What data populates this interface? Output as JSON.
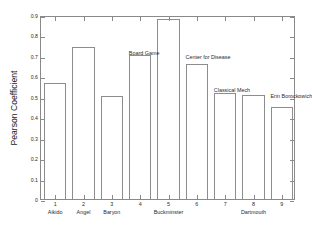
{
  "chart_data": {
    "type": "bar",
    "title": "",
    "xlabel": "",
    "ylabel": "Pearson Coefficient",
    "categories": [
      "1",
      "2",
      "3",
      "4",
      "5",
      "6",
      "7",
      "8",
      "9"
    ],
    "values": [
      0.567,
      0.743,
      0.505,
      0.705,
      0.88,
      0.66,
      0.518,
      0.508,
      0.448
    ],
    "ylim": [
      0,
      0.9
    ],
    "xlim": [
      0.5,
      9.5
    ],
    "ytick_labels": [
      "0",
      "0.1",
      "0.2",
      "0.3",
      "0.4",
      "0.5",
      "0.6",
      "0.7",
      "0.8",
      "0.9"
    ],
    "ytick_values": [
      0,
      0.1,
      0.2,
      0.3,
      0.4,
      0.5,
      0.6,
      0.7,
      0.8,
      0.9
    ],
    "xtick_labels": [
      "1",
      "2",
      "3",
      "4",
      "5",
      "6",
      "7",
      "8",
      "9"
    ],
    "grid": false,
    "legend": "none",
    "bar_fill": "#ffffff",
    "bar_edge": "#8d8d8d",
    "axis_color": "#8a8a8a",
    "category_labels": [
      {
        "text": "Aikido",
        "x": 1
      },
      {
        "text": "Angel",
        "x": 2
      },
      {
        "text": "Baryon",
        "x": 3
      },
      {
        "text": "Buckminster",
        "x": 5
      },
      {
        "text": "Dartmouth",
        "x": 8
      }
    ],
    "annotations": [
      {
        "text": "Board Game",
        "x": 4,
        "y": 0.735
      },
      {
        "text": "Center for Disease",
        "x": 6,
        "y": 0.712
      },
      {
        "text": "Classical Mech",
        "x": 7,
        "y": 0.552
      },
      {
        "text": "Erin Borockowich",
        "x": 9,
        "y": 0.523
      }
    ]
  }
}
